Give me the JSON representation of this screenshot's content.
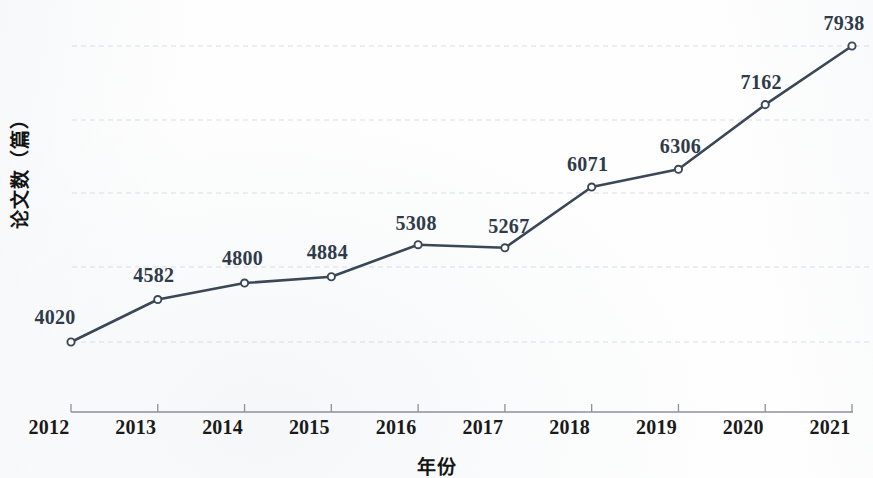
{
  "chart_data": {
    "type": "line",
    "title": "",
    "xlabel": "年份",
    "ylabel": "论文数（篇）",
    "categories": [
      "2012",
      "2013",
      "2014",
      "2015",
      "2016",
      "2017",
      "2018",
      "2019",
      "2020",
      "2021"
    ],
    "values": [
      4020,
      4582,
      4800,
      4884,
      5308,
      5267,
      6071,
      6306,
      7162,
      7938
    ],
    "data_labels": [
      "4020",
      "4582",
      "4800",
      "4884",
      "5308",
      "5267",
      "6071",
      "6306",
      "7162",
      "7938"
    ],
    "series": [
      {
        "name": "论文数",
        "values": [
          4020,
          4582,
          4800,
          4884,
          5308,
          5267,
          6071,
          6306,
          7162,
          7938
        ]
      }
    ],
    "ylim": [
      3925,
      7990
    ],
    "xlim_categories": [
      "2012",
      "2021"
    ],
    "grid": true,
    "grid_style": "dashed-horizontal",
    "legend": "none",
    "marker": "open-circle",
    "line_color": "#3a4757",
    "label_color": "#2f3b4a",
    "grid_color": "#d9dde3",
    "axis_color": "#8d9198",
    "gridline_count": 5
  },
  "axes": {
    "x_tick_labels": [
      "2012",
      "2013",
      "2014",
      "2015",
      "2016",
      "2017",
      "2018",
      "2019",
      "2020",
      "2021"
    ],
    "x_title": "年份",
    "y_title": "论文数（篇）"
  }
}
